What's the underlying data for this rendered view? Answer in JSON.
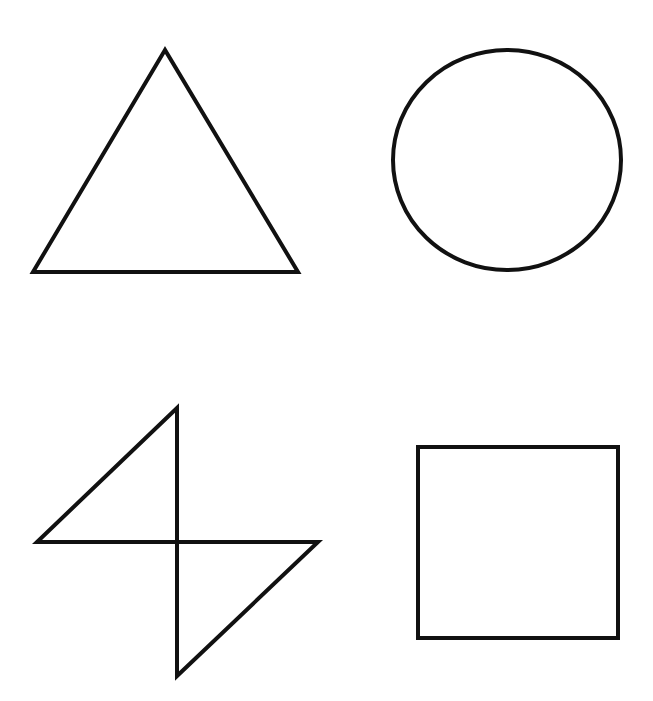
{
  "canvas": {
    "width": 653,
    "height": 701,
    "background": "#ffffff"
  },
  "stroke": {
    "color": "#111111",
    "width": 4
  },
  "shapes": [
    {
      "type": "triangle",
      "points": "165,50 33,272 298,272"
    },
    {
      "type": "circle",
      "cx": 507,
      "cy": 160,
      "rx": 114,
      "ry": 110
    },
    {
      "type": "diamond",
      "points": "177,408 37,542 318,542 177,676"
    },
    {
      "type": "square",
      "x": 418,
      "y": 447,
      "width": 200,
      "height": 191
    }
  ]
}
